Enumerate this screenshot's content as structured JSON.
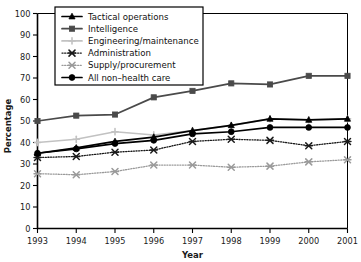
{
  "chart_data": {
    "type": "line",
    "title": "",
    "xlabel": "Year",
    "ylabel": "Percentage",
    "categories": [
      "1993",
      "1994",
      "1995",
      "1996",
      "1997",
      "1998",
      "1999",
      "2000",
      "2001"
    ],
    "x": [
      1993,
      1994,
      1995,
      1996,
      1997,
      1998,
      1999,
      2000,
      2001
    ],
    "xlim": [
      1993,
      2001
    ],
    "ylim": [
      0,
      100
    ],
    "ytick_labels": [
      "0",
      "10",
      "20",
      "30",
      "40",
      "50",
      "60",
      "70",
      "80",
      "90",
      "100"
    ],
    "yticks": [
      0,
      10,
      20,
      30,
      40,
      50,
      60,
      70,
      80,
      90,
      100
    ],
    "grid": false,
    "legend_position": "upper-left",
    "series": [
      {
        "name": "Tactical operations",
        "marker": "triangle",
        "linestyle": "solid",
        "color": "#000000",
        "values": [
          35,
          37.5,
          40.5,
          42.5,
          45.5,
          48,
          51,
          50.5,
          51
        ]
      },
      {
        "name": "Intelligence",
        "marker": "square",
        "linestyle": "solid",
        "color": "#4a4a4a",
        "values": [
          50,
          52.5,
          53,
          61,
          64,
          67.5,
          67,
          71,
          71
        ]
      },
      {
        "name": "Engineering/maintenance",
        "marker": "plus",
        "linestyle": "solid",
        "color": "#c2c2c2",
        "values": [
          40,
          41.5,
          45,
          43.5,
          45.5,
          48,
          51,
          50.5,
          51
        ]
      },
      {
        "name": "Administration",
        "marker": "x",
        "linestyle": "dotted",
        "color": "#1a1a1a",
        "values": [
          33,
          33.5,
          35.5,
          36.5,
          40.5,
          41.5,
          41,
          38.5,
          40.5
        ]
      },
      {
        "name": "Supply/procurement",
        "marker": "x",
        "linestyle": "dotted",
        "color": "#9a9a9a",
        "values": [
          25.5,
          25,
          26.5,
          29.5,
          29.5,
          28.5,
          29,
          31,
          32
        ]
      },
      {
        "name": "All non–health care",
        "marker": "circle",
        "linestyle": "solid",
        "color": "#000000",
        "values": [
          35,
          37,
          39.5,
          41,
          44,
          45,
          47,
          47,
          47
        ]
      }
    ]
  }
}
